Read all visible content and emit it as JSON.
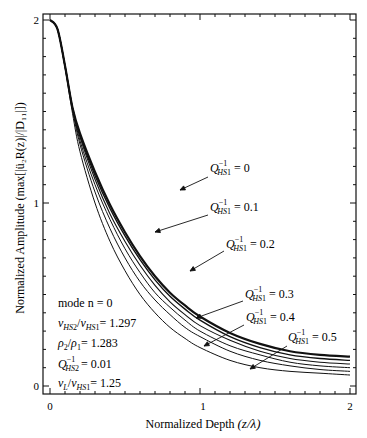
{
  "chart_data": {
    "type": "line",
    "title": "",
    "xlabel": "Normalized Depth (z/λ)",
    "ylabel": "Normalized Amplitude (max[|ü2R(z)|/|D11|])",
    "xlim": [
      0,
      2
    ],
    "ylim": [
      0,
      2
    ],
    "x_ticks": [
      "0",
      "1",
      "2"
    ],
    "y_ticks": [
      "0",
      "1",
      "2"
    ],
    "grid": false,
    "x": [
      0,
      0.05,
      0.1,
      0.15,
      0.2,
      0.3,
      0.4,
      0.5,
      0.6,
      0.7,
      0.8,
      0.9,
      1.0,
      1.2,
      1.4,
      1.6,
      1.8,
      2.0
    ],
    "series": [
      {
        "name": "Q_HS1^-1 = 0",
        "values": [
          2.0,
          1.95,
          1.75,
          1.52,
          1.38,
          1.17,
          0.99,
          0.84,
          0.71,
          0.6,
          0.51,
          0.44,
          0.38,
          0.29,
          0.23,
          0.19,
          0.17,
          0.16
        ]
      },
      {
        "name": "Q_HS1^-1 = 0.1",
        "values": [
          2.0,
          1.95,
          1.75,
          1.52,
          1.37,
          1.15,
          0.97,
          0.82,
          0.69,
          0.58,
          0.49,
          0.42,
          0.36,
          0.27,
          0.21,
          0.17,
          0.15,
          0.14
        ]
      },
      {
        "name": "Q_HS1^-1 = 0.2",
        "values": [
          2.0,
          1.95,
          1.75,
          1.52,
          1.36,
          1.13,
          0.94,
          0.79,
          0.66,
          0.55,
          0.46,
          0.39,
          0.33,
          0.25,
          0.19,
          0.15,
          0.13,
          0.12
        ]
      },
      {
        "name": "Q_HS1^-1 = 0.3",
        "values": [
          2.0,
          1.95,
          1.75,
          1.52,
          1.34,
          1.1,
          0.91,
          0.75,
          0.62,
          0.51,
          0.43,
          0.36,
          0.3,
          0.22,
          0.17,
          0.13,
          0.11,
          0.1
        ]
      },
      {
        "name": "Q_HS1^-1 = 0.4",
        "values": [
          2.0,
          1.95,
          1.75,
          1.51,
          1.32,
          1.06,
          0.86,
          0.7,
          0.57,
          0.47,
          0.39,
          0.32,
          0.27,
          0.19,
          0.14,
          0.11,
          0.09,
          0.08
        ]
      },
      {
        "name": "Q_HS1^-1 = 0.5",
        "values": [
          2.0,
          1.95,
          1.74,
          1.49,
          1.28,
          1.0,
          0.79,
          0.63,
          0.5,
          0.4,
          0.32,
          0.26,
          0.21,
          0.14,
          0.1,
          0.08,
          0.07,
          0.06
        ]
      }
    ],
    "annotations": [
      {
        "text": "Q_HS1^-1 = 0",
        "x": 1.07,
        "y": 1.18
      },
      {
        "text": "Q_HS1^-1 = 0.1",
        "x": 1.07,
        "y": 0.92
      },
      {
        "text": "Q_HS1^-1 = 0.2",
        "x": 1.2,
        "y": 0.74
      },
      {
        "text": "Q_HS1^-1 = 0.3",
        "x": 1.35,
        "y": 0.57
      },
      {
        "text": "Q_HS1^-1 = 0.4",
        "x": 1.5,
        "y": 0.41
      },
      {
        "text": "Q_HS1^-1 = 0.5",
        "x": 1.72,
        "y": 0.27
      }
    ],
    "parameters": [
      "mode n = 0",
      "v_HS2/v_HS1 = 1.297",
      "ρ2/ρ1 = 1.283",
      "Q_HS2^-1 = 0.01",
      "v_L/v_HS1 = 1.25"
    ]
  },
  "labels": {
    "xlabel_main": "Normalized Depth ",
    "xlabel_math": "(z/λ)",
    "ylabel_main": "Normalized Amplitude ",
    "ylabel_math": "(max[|ü₂R(z)|/|D₁₁|])",
    "tick_x0": "0",
    "tick_x1": "1",
    "tick_x2": "2",
    "tick_y0": "0",
    "tick_y1": "1",
    "tick_y2": "2",
    "q0": "= 0",
    "q1": "= 0.1",
    "q2": "= 0.2",
    "q3": "= 0.3",
    "q4": "= 0.4",
    "q5": "= 0.5",
    "p_mode": "mode n  =  0",
    "p_vel": "= 1.297",
    "p_rho": "= 1.283",
    "p_q2": "= 0.01",
    "p_vl": "= 1.25"
  }
}
